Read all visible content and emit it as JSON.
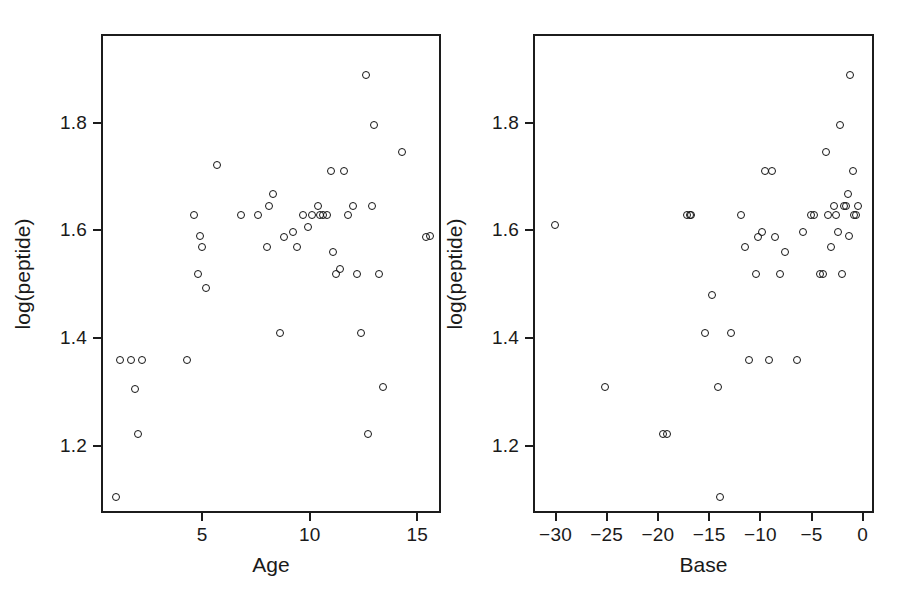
{
  "figure": {
    "background_color": "#ffffff",
    "ink_color": "#1a1a1a",
    "marker": "open-circle",
    "panel_count": 2
  },
  "chart_data": [
    {
      "type": "scatter",
      "title": "",
      "xlabel": "Age",
      "ylabel": "log(peptide)",
      "xlim": [
        0.3,
        16.1
      ],
      "ylim": [
        1.075,
        1.965
      ],
      "xticks": [
        5,
        10,
        15
      ],
      "xticklabels": [
        "5",
        "10",
        "15"
      ],
      "yticks": [
        1.2,
        1.4,
        1.6,
        1.8
      ],
      "yticklabels": [
        "1.2",
        "1.4",
        "1.6",
        "1.8"
      ],
      "grid": false,
      "legend": "none",
      "x": [
        1.0,
        1.2,
        1.7,
        1.9,
        2.0,
        2.2,
        4.3,
        4.6,
        4.8,
        4.9,
        5.0,
        5.2,
        5.7,
        6.8,
        7.6,
        8.0,
        8.1,
        8.3,
        8.6,
        8.8,
        9.2,
        9.4,
        9.7,
        9.9,
        10.1,
        10.4,
        10.5,
        10.6,
        10.8,
        11.0,
        11.1,
        11.2,
        11.4,
        11.6,
        11.8,
        12.0,
        12.2,
        12.4,
        12.6,
        12.7,
        12.9,
        13.0,
        13.2,
        13.4,
        14.3,
        15.4,
        15.6
      ],
      "y": [
        1.105,
        1.36,
        1.36,
        1.305,
        1.222,
        1.36,
        1.36,
        1.628,
        1.52,
        1.59,
        1.57,
        1.493,
        1.722,
        1.628,
        1.628,
        1.57,
        1.645,
        1.667,
        1.41,
        1.588,
        1.598,
        1.57,
        1.628,
        1.607,
        1.628,
        1.645,
        1.628,
        1.628,
        1.628,
        1.71,
        1.56,
        1.52,
        1.528,
        1.71,
        1.628,
        1.645,
        1.52,
        1.41,
        1.888,
        1.222,
        1.645,
        1.795,
        1.52,
        1.31,
        1.745,
        1.588,
        1.59
      ],
      "n_points": 47
    },
    {
      "type": "scatter",
      "title": "",
      "xlabel": "Base",
      "ylabel": "log(peptide)",
      "xlim": [
        -32.2,
        1.1
      ],
      "ylim": [
        1.075,
        1.965
      ],
      "xticks": [
        -30,
        -25,
        -20,
        -15,
        -10,
        -5,
        0
      ],
      "xticklabels": [
        "−30",
        "−25",
        "−20",
        "−15",
        "−10",
        "−5",
        "0"
      ],
      "yticks": [
        1.2,
        1.4,
        1.6,
        1.8
      ],
      "yticklabels": [
        "1.2",
        "1.4",
        "1.6",
        "1.8"
      ],
      "grid": false,
      "legend": "none",
      "x": [
        -30.1,
        -25.2,
        -19.5,
        -19.1,
        -17.2,
        -16.9,
        -16.8,
        -15.4,
        -14.7,
        -14.1,
        -13.9,
        -12.9,
        -11.9,
        -11.5,
        -11.1,
        -10.4,
        -10.2,
        -9.8,
        -9.5,
        -9.2,
        -8.9,
        -8.6,
        -8.1,
        -7.6,
        -6.4,
        -5.8,
        -5.1,
        -4.8,
        -4.2,
        -3.9,
        -3.6,
        -3.4,
        -3.1,
        -2.8,
        -2.6,
        -2.4,
        -2.2,
        -2.0,
        -1.8,
        -1.6,
        -1.4,
        -1.3,
        -1.2,
        -1.0,
        -0.9,
        -0.7,
        -0.5
      ],
      "y": [
        1.61,
        1.31,
        1.222,
        1.222,
        1.628,
        1.628,
        1.628,
        1.41,
        1.48,
        1.31,
        1.105,
        1.41,
        1.628,
        1.57,
        1.36,
        1.52,
        1.588,
        1.598,
        1.71,
        1.36,
        1.71,
        1.588,
        1.52,
        1.56,
        1.36,
        1.598,
        1.628,
        1.628,
        1.52,
        1.52,
        1.745,
        1.628,
        1.57,
        1.645,
        1.628,
        1.598,
        1.795,
        1.52,
        1.645,
        1.645,
        1.667,
        1.59,
        1.888,
        1.71,
        1.628,
        1.628,
        1.645
      ],
      "n_points": 47
    }
  ]
}
